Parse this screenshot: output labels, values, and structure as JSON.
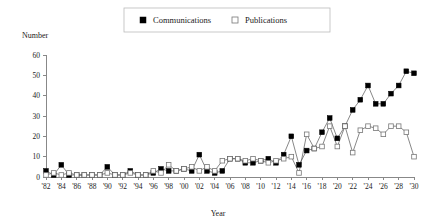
{
  "chart_data": {
    "type": "line",
    "title": "",
    "xlabel": "Year",
    "ylabel": "Number",
    "ylim": [
      0,
      60
    ],
    "yticks": [
      0,
      10,
      20,
      30,
      40,
      50,
      60
    ],
    "grid": false,
    "legend_position": "top-center",
    "x": [
      1982,
      1983,
      1984,
      1985,
      1986,
      1987,
      1988,
      1989,
      1990,
      1991,
      1992,
      1993,
      1994,
      1995,
      1996,
      1997,
      1998,
      1999,
      2000,
      2001,
      2002,
      2003,
      2004,
      2005,
      2006,
      2007,
      2008,
      2009,
      2010,
      2011,
      2012,
      2013,
      2014,
      2015,
      2016,
      2017,
      2018,
      2019,
      2020,
      2021,
      2022,
      2023,
      2024,
      2025,
      2026,
      2027,
      2028,
      2029,
      2030
    ],
    "xtick_labels": [
      "'82",
      "'84",
      "'86",
      "'88",
      "'90",
      "'92",
      "'94",
      "'96",
      "'98",
      "'00",
      "'02",
      "'04",
      "'06",
      "'08",
      "'10",
      "'12",
      "'14",
      "'16",
      "'18",
      "'20",
      "'22",
      "'24",
      "'26",
      "'28",
      "'30"
    ],
    "xtick_values": [
      1982,
      1984,
      1986,
      1988,
      1990,
      1992,
      1994,
      1996,
      1998,
      2000,
      2002,
      2004,
      2006,
      2008,
      2010,
      2012,
      2014,
      2016,
      2018,
      2020,
      2022,
      2024,
      2026,
      2028,
      2030
    ],
    "series": [
      {
        "name": "Communications",
        "marker": "filled-square",
        "color": "#000000",
        "values": [
          3,
          1,
          6,
          1,
          1,
          1,
          1,
          1,
          5,
          1,
          1,
          3,
          1,
          1,
          2,
          4,
          3,
          3,
          4,
          3,
          11,
          3,
          2,
          3,
          9,
          9,
          7,
          7,
          8,
          9,
          7,
          11,
          20,
          6,
          13,
          14,
          22,
          29,
          19,
          25,
          33,
          38,
          45,
          36,
          36,
          41,
          45,
          52,
          51
        ]
      },
      {
        "name": "Publications",
        "marker": "open-square",
        "color": "#ffffff",
        "values": [
          1,
          2,
          1,
          2,
          1,
          1,
          1,
          1,
          2,
          1,
          1,
          2,
          1,
          1,
          3,
          2,
          6,
          3,
          4,
          5,
          3,
          5,
          3,
          8,
          9,
          9,
          8,
          9,
          8,
          7,
          8,
          9,
          10,
          2,
          21,
          14,
          15,
          25,
          15,
          25,
          12,
          23,
          25,
          24,
          21,
          25,
          25,
          22,
          10
        ]
      }
    ]
  },
  "legend": {
    "items": [
      {
        "label": "Communications",
        "marker": "filled-square"
      },
      {
        "label": "Publications",
        "marker": "open-square"
      }
    ]
  },
  "axes": {
    "y_title": "Number",
    "x_title": "Year"
  }
}
